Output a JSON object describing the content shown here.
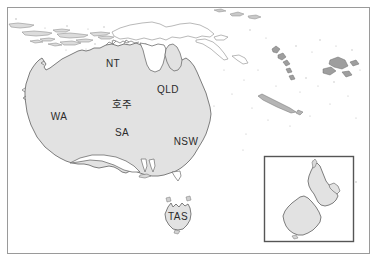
{
  "map": {
    "title": "Australia and New Zealand reference map",
    "frame": {
      "border_color": "#9a9a9a",
      "background_color": "#ffffff"
    },
    "style": {
      "land_fill": "#e2e2e2",
      "land_stroke": "#6f6f6f",
      "outline_only_fill": "#ffffff",
      "outline_only_stroke": "#9b9b9b",
      "island_fill": "#d9d9d9",
      "island_stroke": "#777777",
      "label_color": "#2b2b2b",
      "inset_border_color": "#555555"
    },
    "labels": [
      {
        "id": "nt",
        "text": "NT",
        "x": 113,
        "y": 64,
        "kind": "state-abbrev"
      },
      {
        "id": "qld",
        "text": "QLD",
        "x": 168,
        "y": 90,
        "kind": "state-abbrev"
      },
      {
        "id": "wa",
        "text": "WA",
        "x": 59,
        "y": 117,
        "kind": "state-abbrev"
      },
      {
        "id": "sa",
        "text": "SA",
        "x": 122,
        "y": 133,
        "kind": "state-abbrev"
      },
      {
        "id": "nsw",
        "text": "NSW",
        "x": 186,
        "y": 142,
        "kind": "state-abbrev"
      },
      {
        "id": "tas",
        "text": "TAS",
        "x": 178,
        "y": 217,
        "kind": "state-abbrev"
      }
    ],
    "country_label": {
      "id": "australia-ko",
      "text": "호주",
      "x": 122,
      "y": 105,
      "language": "ko",
      "meaning": "Australia"
    },
    "inset": {
      "name": "New Zealand inset",
      "x": 264,
      "y": 156,
      "width": 90,
      "height": 86
    },
    "regions": [
      {
        "id": "australia-mainland",
        "name": "Australia"
      },
      {
        "id": "tasmania",
        "name": "Tasmania"
      },
      {
        "id": "new-zealand-north",
        "name": "New Zealand North Island"
      },
      {
        "id": "new-zealand-south",
        "name": "New Zealand South Island"
      },
      {
        "id": "indonesia-arc",
        "name": "Indonesian archipelago"
      },
      {
        "id": "new-guinea",
        "name": "New Guinea"
      },
      {
        "id": "vanuatu",
        "name": "Vanuatu"
      },
      {
        "id": "new-caledonia",
        "name": "New Caledonia"
      },
      {
        "id": "fiji",
        "name": "Fiji"
      }
    ]
  }
}
